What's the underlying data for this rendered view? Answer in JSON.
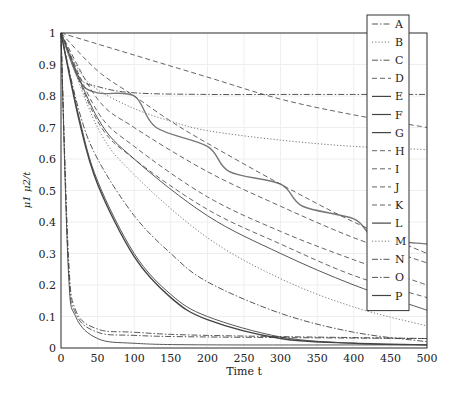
{
  "chart_data": {
    "type": "line",
    "title": "",
    "xlabel": "Time t",
    "ylabel": "μ1 μ2/t",
    "xlim": [
      0,
      500
    ],
    "ylim": [
      0,
      1
    ],
    "grid": true,
    "legend_position": "upper right",
    "xticks": [
      "0",
      "50",
      "100",
      "150",
      "200",
      "250",
      "300",
      "350",
      "400",
      "450",
      "500"
    ],
    "yticks": [
      "0",
      "0.1",
      "0.2",
      "0.3",
      "0.4",
      "0.5",
      "0.6",
      "0.7",
      "0.8",
      "0.9",
      "1"
    ],
    "series": [
      {
        "name": "A",
        "style": "dashdot",
        "x": [
          0,
          25,
          50,
          100,
          150,
          200,
          300,
          400,
          500
        ],
        "values": [
          1,
          0.75,
          0.6,
          0.42,
          0.3,
          0.21,
          0.11,
          0.05,
          0.02
        ]
      },
      {
        "name": "B",
        "style": "dotted",
        "x": [
          0,
          25,
          50,
          100,
          150,
          200,
          300,
          400,
          500
        ],
        "values": [
          1,
          0.88,
          0.82,
          0.76,
          0.72,
          0.69,
          0.66,
          0.64,
          0.63
        ]
      },
      {
        "name": "C",
        "style": "dashdot",
        "x": [
          0,
          25,
          50,
          100,
          200,
          300,
          400,
          500
        ],
        "values": [
          1,
          0.86,
          0.83,
          0.81,
          0.805,
          0.805,
          0.805,
          0.805
        ]
      },
      {
        "name": "D",
        "style": "dashed",
        "x": [
          0,
          100,
          200,
          300,
          400,
          500
        ],
        "values": [
          1,
          0.93,
          0.86,
          0.79,
          0.74,
          0.7
        ]
      },
      {
        "name": "E",
        "style": "solid",
        "x": [
          0,
          25,
          50,
          100,
          150,
          200,
          300,
          400,
          500
        ],
        "values": [
          1,
          0.72,
          0.52,
          0.29,
          0.16,
          0.09,
          0.03,
          0.015,
          0.01
        ]
      },
      {
        "name": "F",
        "style": "solid",
        "x": [
          0,
          25,
          50,
          100,
          130,
          200,
          230,
          300,
          330,
          400,
          430,
          500
        ],
        "values": [
          1,
          0.85,
          0.81,
          0.8,
          0.7,
          0.64,
          0.56,
          0.52,
          0.45,
          0.41,
          0.35,
          0.33
        ]
      },
      {
        "name": "G",
        "style": "solid",
        "x": [
          0,
          10,
          20,
          50,
          100,
          200,
          500
        ],
        "values": [
          1,
          0.25,
          0.1,
          0.03,
          0.015,
          0.01,
          0.01
        ]
      },
      {
        "name": "H",
        "style": "dashed",
        "x": [
          0,
          50,
          100,
          150,
          200,
          300,
          400,
          500
        ],
        "values": [
          1,
          0.88,
          0.8,
          0.72,
          0.65,
          0.52,
          0.4,
          0.3
        ]
      },
      {
        "name": "I",
        "style": "dashed",
        "x": [
          0,
          50,
          100,
          200,
          300,
          400,
          500
        ],
        "values": [
          1,
          0.79,
          0.7,
          0.56,
          0.45,
          0.35,
          0.27
        ]
      },
      {
        "name": "J",
        "style": "dashed",
        "x": [
          0,
          50,
          100,
          200,
          300,
          400,
          500
        ],
        "values": [
          1,
          0.75,
          0.64,
          0.48,
          0.37,
          0.28,
          0.2
        ]
      },
      {
        "name": "K",
        "style": "dashed",
        "x": [
          0,
          50,
          100,
          200,
          300,
          400,
          500
        ],
        "values": [
          1,
          0.72,
          0.6,
          0.44,
          0.33,
          0.23,
          0.16
        ]
      },
      {
        "name": "L",
        "style": "solid",
        "x": [
          0,
          50,
          100,
          200,
          300,
          400,
          500
        ],
        "values": [
          1,
          0.73,
          0.6,
          0.42,
          0.3,
          0.2,
          0.12
        ]
      },
      {
        "name": "M",
        "style": "dotted",
        "x": [
          0,
          50,
          100,
          200,
          300,
          400,
          500
        ],
        "values": [
          1,
          0.7,
          0.55,
          0.35,
          0.22,
          0.13,
          0.07
        ]
      },
      {
        "name": "N",
        "style": "dashdot",
        "x": [
          0,
          10,
          20,
          50,
          100,
          200,
          500
        ],
        "values": [
          1,
          0.3,
          0.12,
          0.06,
          0.05,
          0.04,
          0.03
        ]
      },
      {
        "name": "O",
        "style": "dashdot",
        "x": [
          0,
          10,
          20,
          50,
          100,
          200,
          500
        ],
        "values": [
          1,
          0.27,
          0.11,
          0.05,
          0.04,
          0.035,
          0.03
        ]
      },
      {
        "name": "P",
        "style": "solid",
        "x": [
          0,
          25,
          50,
          100,
          150,
          200,
          300,
          400,
          500
        ],
        "values": [
          1,
          0.73,
          0.53,
          0.3,
          0.17,
          0.1,
          0.035,
          0.015,
          0.01
        ]
      }
    ]
  },
  "axes": {
    "xlabel": "Time t",
    "ylabel_main": "μ",
    "ylabel_sub1": "1",
    "ylabel_frac": "μ2/t"
  },
  "legend": {
    "items": [
      "A",
      "B",
      "C",
      "D",
      "E",
      "F",
      "G",
      "H",
      "I",
      "J",
      "K",
      "L",
      "M",
      "N",
      "O",
      "P"
    ]
  }
}
